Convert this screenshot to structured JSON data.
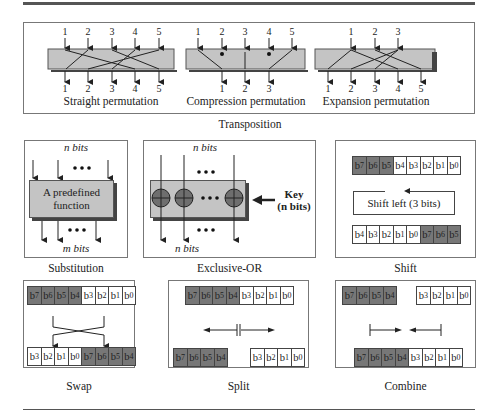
{
  "transposition": {
    "title": "Transposition",
    "straight": {
      "caption": "Straight permutation",
      "inputs": [
        "1",
        "2",
        "3",
        "4",
        "5"
      ],
      "outputs": [
        "1",
        "2",
        "3",
        "4",
        "5"
      ]
    },
    "compression": {
      "caption": "Compression permutation",
      "inputs": [
        "1",
        "2",
        "3",
        "4",
        "5"
      ],
      "outputs": [
        "1",
        "2",
        "3"
      ]
    },
    "expansion": {
      "caption": "Expansion permutation",
      "inputs": [
        "1",
        "2",
        "3"
      ],
      "outputs": [
        "1",
        "2",
        "3",
        "4",
        "5"
      ]
    }
  },
  "substitution": {
    "caption": "Substitution",
    "input_label": "n bits",
    "output_label": "m bits",
    "box_line1": "A predefined",
    "box_line2": "function"
  },
  "xor": {
    "caption": "Exclusive-OR",
    "input_label": "n bits",
    "output_label": "n bits",
    "key_line1": "Key",
    "key_line2": "(n bits)"
  },
  "shift": {
    "caption": "Shift",
    "operation": "Shift left (3 bits)",
    "before": [
      {
        "b": "7",
        "d": true
      },
      {
        "b": "6",
        "d": true
      },
      {
        "b": "5",
        "d": true
      },
      {
        "b": "4",
        "d": false
      },
      {
        "b": "3",
        "d": false
      },
      {
        "b": "2",
        "d": false
      },
      {
        "b": "1",
        "d": false
      },
      {
        "b": "0",
        "d": false
      }
    ],
    "after": [
      {
        "b": "4",
        "d": false
      },
      {
        "b": "3",
        "d": false
      },
      {
        "b": "2",
        "d": false
      },
      {
        "b": "1",
        "d": false
      },
      {
        "b": "0",
        "d": false
      },
      {
        "b": "7",
        "d": true
      },
      {
        "b": "6",
        "d": true
      },
      {
        "b": "5",
        "d": true
      }
    ]
  },
  "swap": {
    "caption": "Swap",
    "before": [
      {
        "b": "7",
        "d": true
      },
      {
        "b": "6",
        "d": true
      },
      {
        "b": "5",
        "d": true
      },
      {
        "b": "4",
        "d": true
      },
      {
        "b": "3",
        "d": false
      },
      {
        "b": "2",
        "d": false
      },
      {
        "b": "1",
        "d": false
      },
      {
        "b": "0",
        "d": false
      }
    ],
    "after": [
      {
        "b": "3",
        "d": false
      },
      {
        "b": "2",
        "d": false
      },
      {
        "b": "1",
        "d": false
      },
      {
        "b": "0",
        "d": false
      },
      {
        "b": "7",
        "d": true
      },
      {
        "b": "6",
        "d": true
      },
      {
        "b": "5",
        "d": true
      },
      {
        "b": "4",
        "d": true
      }
    ]
  },
  "split": {
    "caption": "Split",
    "before": [
      {
        "b": "7",
        "d": true
      },
      {
        "b": "6",
        "d": true
      },
      {
        "b": "5",
        "d": true
      },
      {
        "b": "4",
        "d": true
      },
      {
        "b": "3",
        "d": false
      },
      {
        "b": "2",
        "d": false
      },
      {
        "b": "1",
        "d": false
      },
      {
        "b": "0",
        "d": false
      }
    ],
    "left": [
      {
        "b": "7",
        "d": true
      },
      {
        "b": "6",
        "d": true
      },
      {
        "b": "5",
        "d": true
      },
      {
        "b": "4",
        "d": true
      }
    ],
    "right": [
      {
        "b": "3",
        "d": false
      },
      {
        "b": "2",
        "d": false
      },
      {
        "b": "1",
        "d": false
      },
      {
        "b": "0",
        "d": false
      }
    ]
  },
  "combine": {
    "caption": "Combine",
    "left": [
      {
        "b": "7",
        "d": true
      },
      {
        "b": "6",
        "d": true
      },
      {
        "b": "5",
        "d": true
      },
      {
        "b": "4",
        "d": true
      }
    ],
    "right": [
      {
        "b": "3",
        "d": false
      },
      {
        "b": "2",
        "d": false
      },
      {
        "b": "1",
        "d": false
      },
      {
        "b": "0",
        "d": false
      }
    ],
    "after": [
      {
        "b": "7",
        "d": true
      },
      {
        "b": "6",
        "d": true
      },
      {
        "b": "5",
        "d": true
      },
      {
        "b": "4",
        "d": true
      },
      {
        "b": "3",
        "d": false
      },
      {
        "b": "2",
        "d": false
      },
      {
        "b": "1",
        "d": false
      },
      {
        "b": "0",
        "d": false
      }
    ]
  },
  "colors": {
    "box_fill": "#c4c4c4",
    "dark_bit": "#777777",
    "xor_circle": "#6e6e6e"
  }
}
